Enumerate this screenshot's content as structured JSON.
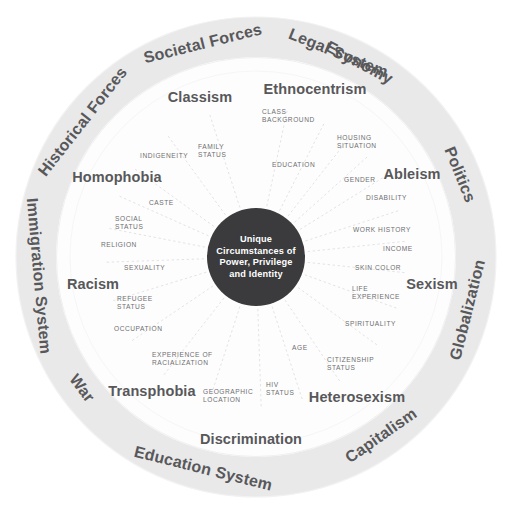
{
  "diagram": {
    "colors": {
      "background": "#ffffff",
      "outer_ring_band": "#e8e8e9",
      "middle_ring": "#fcfcfc",
      "core_circle": "#3b3b3d",
      "core_text": "#ffffff",
      "ring_label_text": "#58585a",
      "attr_label_text": "#6d6e71",
      "spoke_line": "#d9d9da"
    },
    "core": {
      "lines": [
        "Unique",
        "Circumstances of",
        "Power, Privilege",
        "and Identity"
      ],
      "center_x": 256,
      "center_y": 257,
      "radius": 49
    },
    "rings": {
      "outer_radius": 240,
      "outer_inner_radius": 200,
      "middle_outer_radius": 200,
      "middle_inner_radius": 49
    },
    "outer_ring": {
      "name": "systems-and-forces-ring",
      "labels": [
        {
          "text": "Economy",
          "angle": -62
        },
        {
          "text": "Politics",
          "angle": -22
        },
        {
          "text": "Globalization",
          "angle": 14
        },
        {
          "text": "Capitalism",
          "angle": 55
        },
        {
          "text": "Education System",
          "angle": 104
        },
        {
          "text": "War",
          "angle": 143
        },
        {
          "text": "Immigration System",
          "angle": 175
        },
        {
          "text": "Historical Forces",
          "angle": 218
        },
        {
          "text": "Societal Forces",
          "angle": 256
        },
        {
          "text": "Legal System",
          "angle": 292
        },
        {
          "text": "Ethnocentrism",
          "angle": 0
        },
        {
          "text": "Discrimination",
          "angle": 0
        }
      ]
    },
    "outer_ring_items": [
      "Economy",
      "Politics",
      "Globalization",
      "Capitalism",
      "Education System",
      "War",
      "Immigration System",
      "Historical Forces",
      "Societal Forces",
      "Legal System"
    ],
    "middle_ring_isms": [
      {
        "text": "Classism",
        "x": 200,
        "y": 98
      },
      {
        "text": "Ethnocentrism",
        "x": 315,
        "y": 90
      },
      {
        "text": "Ableism",
        "x": 412,
        "y": 175
      },
      {
        "text": "Sexism",
        "x": 432,
        "y": 285
      },
      {
        "text": "Heterosexism",
        "x": 357,
        "y": 398
      },
      {
        "text": "Transphobia",
        "x": 152,
        "y": 392
      },
      {
        "text": "Racism",
        "x": 93,
        "y": 285
      },
      {
        "text": "Homophobia",
        "x": 117,
        "y": 178
      },
      {
        "text": "Discrimination",
        "x": 251,
        "y": 440
      },
      {
        "text": "Ethnocentrism2",
        "x": 0,
        "y": 0
      }
    ],
    "attributes": [
      {
        "label": "CLASS BACKGROUND",
        "lines": [
          "CLASS",
          "BACKGROUND"
        ],
        "x": 262,
        "y": 114,
        "anchor": "start",
        "angle": -78
      },
      {
        "label": "HOUSING SITUATION",
        "lines": [
          "HOUSING",
          "SITUATION"
        ],
        "x": 337,
        "y": 140,
        "anchor": "start",
        "angle": -52
      },
      {
        "label": "EDUCATION",
        "lines": [
          "EDUCATION"
        ],
        "x": 272,
        "y": 167,
        "anchor": "start",
        "angle": -63
      },
      {
        "label": "GENDER",
        "lines": [
          "GENDER"
        ],
        "x": 344,
        "y": 182,
        "anchor": "start",
        "angle": -42
      },
      {
        "label": "DISABILITY",
        "lines": [
          "DISABILITY"
        ],
        "x": 366,
        "y": 200,
        "anchor": "start",
        "angle": -32
      },
      {
        "label": "WORK HISTORY",
        "lines": [
          "WORK HISTORY"
        ],
        "x": 353,
        "y": 232,
        "anchor": "start",
        "angle": -18
      },
      {
        "label": "INCOME",
        "lines": [
          "INCOME"
        ],
        "x": 383,
        "y": 251,
        "anchor": "start",
        "angle": -6
      },
      {
        "label": "SKIN COLOR",
        "lines": [
          "SKIN COLOR"
        ],
        "x": 355,
        "y": 270,
        "anchor": "start",
        "angle": 6
      },
      {
        "label": "LIFE EXPERIENCE",
        "lines": [
          "LIFE",
          "EXPERIENCE"
        ],
        "x": 352,
        "y": 291,
        "anchor": "start",
        "angle": 20
      },
      {
        "label": "SPIRITUALITY",
        "lines": [
          "SPIRITUALITY"
        ],
        "x": 345,
        "y": 326,
        "anchor": "start",
        "angle": 36
      },
      {
        "label": "CITIZENSHIP STATUS",
        "lines": [
          "CITIZENSHIP",
          "STATUS"
        ],
        "x": 327,
        "y": 362,
        "anchor": "start",
        "angle": 56
      },
      {
        "label": "AGE",
        "lines": [
          "AGE"
        ],
        "x": 292,
        "y": 350,
        "anchor": "start",
        "angle": 72
      },
      {
        "label": "HIV STATUS",
        "lines": [
          "HIV",
          "STATUS"
        ],
        "x": 266,
        "y": 387,
        "anchor": "start",
        "angle": 88
      },
      {
        "label": "GEOGRAPHIC LOCATION",
        "lines": [
          "GEOGRAPHIC",
          "LOCATION"
        ],
        "x": 203,
        "y": 394,
        "anchor": "start",
        "angle": 108
      },
      {
        "label": "EXPERIENCE OF RACIALIZATION",
        "lines": [
          "EXPERIENCE OF",
          "RACIALIZATION"
        ],
        "x": 152,
        "y": 357,
        "anchor": "start",
        "angle": 128
      },
      {
        "label": "OCCUPATION",
        "lines": [
          "OCCUPATION"
        ],
        "x": 114,
        "y": 331,
        "anchor": "start",
        "angle": 146
      },
      {
        "label": "REFUGEE STATUS",
        "lines": [
          "REFUGEE",
          "STATUS"
        ],
        "x": 117,
        "y": 301,
        "anchor": "start",
        "angle": 163
      },
      {
        "label": "SEXUALITY",
        "lines": [
          "SEXUALITY"
        ],
        "x": 124,
        "y": 270,
        "anchor": "start",
        "angle": 178
      },
      {
        "label": "RELIGION",
        "lines": [
          "RELIGION"
        ],
        "x": 101,
        "y": 247,
        "anchor": "start",
        "angle": 191
      },
      {
        "label": "SOCIAL STATUS",
        "lines": [
          "SOCIAL",
          "STATUS"
        ],
        "x": 115,
        "y": 221,
        "anchor": "start",
        "angle": 204
      },
      {
        "label": "CASTE",
        "lines": [
          "CASTE"
        ],
        "x": 149,
        "y": 205,
        "anchor": "start",
        "angle": 216
      },
      {
        "label": "INDIGENEITY",
        "lines": [
          "INDIGENEITY"
        ],
        "x": 140,
        "y": 158,
        "anchor": "start",
        "angle": 234
      },
      {
        "label": "FAMILY STATUS",
        "lines": [
          "FAMILY",
          "STATUS"
        ],
        "x": 198,
        "y": 149,
        "anchor": "start",
        "angle": 252
      }
    ],
    "spokes": {
      "count": 23,
      "style": "dashed",
      "note": "thin light-grey dashed radial lines from core circle outward"
    }
  }
}
